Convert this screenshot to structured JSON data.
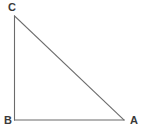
{
  "figure": {
    "kind": "geometry-diagram",
    "shape": "right-triangle",
    "width": 147,
    "height": 136,
    "background_color": "#ffffff",
    "stroke_color": "#6b6b6b",
    "stroke_width": 1.1,
    "label_color": "#3a3a3a"
  },
  "labels": {
    "top_left": "C",
    "bottom_left": "B",
    "bottom_right": "A"
  },
  "geometry": {
    "points": {
      "C": {
        "x": 14.5,
        "y": 16
      },
      "B": {
        "x": 14.5,
        "y": 120
      },
      "A": {
        "x": 124,
        "y": 120
      }
    },
    "edges": [
      {
        "name": "leg-CB",
        "from": "C",
        "to": "B"
      },
      {
        "name": "leg-BA",
        "from": "B",
        "to": "A"
      },
      {
        "name": "hypotenuse-CA",
        "from": "C",
        "to": "A"
      }
    ],
    "right_angle_at": "B"
  }
}
